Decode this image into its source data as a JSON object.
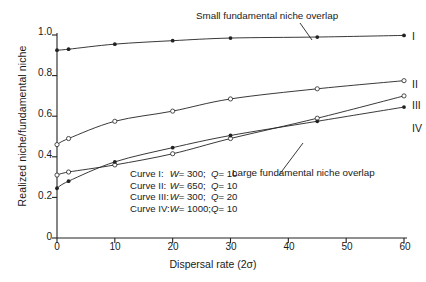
{
  "chart_data": {
    "type": "line",
    "title": "",
    "xlabel": "Dispersal rate (2σ)",
    "ylabel": "Realized niche/fundamental niche",
    "xlim": [
      0,
      60
    ],
    "ylim": [
      0,
      1.0
    ],
    "xticks": [
      0,
      10,
      20,
      30,
      40,
      50,
      60
    ],
    "yticks": [
      0,
      0.2,
      0.4,
      0.6,
      0.8,
      1.0
    ],
    "ytick_labels": [
      "0",
      "0.2",
      "0.4",
      "0.6",
      "0.8",
      "1.0"
    ],
    "xtick_labels": [
      "0",
      "10",
      "20",
      "30",
      "40",
      "50",
      "60"
    ],
    "grid": false,
    "legend_position": "inside-lower-center",
    "series": [
      {
        "name": "I",
        "label": "I",
        "marker": "filled-circle",
        "color": "#222222",
        "x": [
          0,
          2,
          10,
          20,
          30,
          45,
          60
        ],
        "y": [
          0.925,
          0.93,
          0.955,
          0.972,
          0.985,
          0.99,
          0.998
        ]
      },
      {
        "name": "II",
        "label": "II",
        "marker": "open-circle",
        "color": "#222222",
        "x": [
          0,
          2,
          10,
          20,
          30,
          45,
          60
        ],
        "y": [
          0.46,
          0.49,
          0.575,
          0.625,
          0.685,
          0.735,
          0.775
        ]
      },
      {
        "name": "III",
        "label": "III",
        "marker": "open-circle",
        "color": "#222222",
        "x": [
          0,
          2,
          10,
          20,
          30,
          45,
          60
        ],
        "y": [
          0.31,
          0.325,
          0.36,
          0.415,
          0.49,
          0.59,
          0.7
        ]
      },
      {
        "name": "IV",
        "label": "IV",
        "marker": "filled-circle",
        "color": "#222222",
        "x": [
          0,
          2,
          10,
          20,
          30,
          45,
          60
        ],
        "y": [
          0.245,
          0.28,
          0.375,
          0.445,
          0.505,
          0.575,
          0.645
        ]
      }
    ],
    "annotations": [
      {
        "name": "small-overlap-annotation",
        "text": "Small fundamental niche overlap",
        "points_to_series": "I"
      },
      {
        "name": "large-overlap-annotation",
        "text": "Large fundamental niche overlap",
        "points_to_series": "IV"
      }
    ],
    "legend_rows": [
      {
        "curve": "Curve I:",
        "param1": "W",
        "eq1": "=",
        "value1": "300;",
        "param2": "Q",
        "eq2": "=",
        "value2": "10"
      },
      {
        "curve": "Curve II:",
        "param1": "W",
        "eq1": "=",
        "value1": "650;",
        "param2": "Q",
        "eq2": "=",
        "value2": "10"
      },
      {
        "curve": "Curve III:",
        "param1": "W",
        "eq1": "=",
        "value1": "300;",
        "param2": "Q",
        "eq2": "=",
        "value2": "20"
      },
      {
        "curve": "Curve IV:",
        "param1": "W",
        "eq1": "=",
        "value1": "1000;",
        "param2": "Q",
        "eq2": "=",
        "value2": "10"
      }
    ]
  },
  "axis": {
    "ylabel": "Realized niche/fundamental niche",
    "xlabel": "Dispersal rate (2σ)",
    "ytick_0": "0",
    "ytick_1": "0.2",
    "ytick_2": "0.4",
    "ytick_3": "0.6",
    "ytick_4": "0.8",
    "ytick_5": "1.0",
    "xtick_0": "0",
    "xtick_1": "10",
    "xtick_2": "20",
    "xtick_3": "30",
    "xtick_4": "40",
    "xtick_5": "50",
    "xtick_6": "60"
  },
  "curve_labels": {
    "I": "I",
    "II": "II",
    "III": "III",
    "IV": "IV"
  },
  "annotations": {
    "small": "Small fundamental niche overlap",
    "large": "Large fundamental niche overlap"
  },
  "colors": {
    "ink": "#222222",
    "background": "#ffffff"
  }
}
